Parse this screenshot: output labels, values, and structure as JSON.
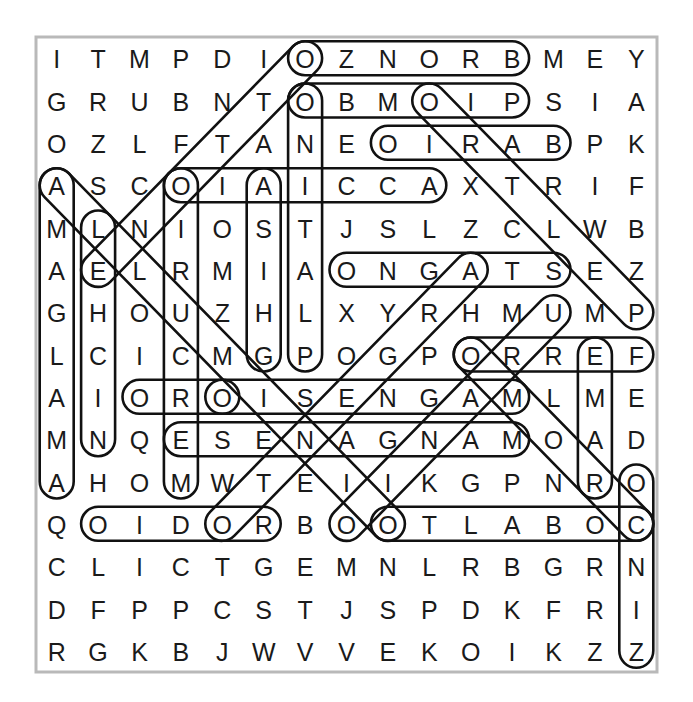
{
  "puzzle": {
    "type": "word-search",
    "rows": 15,
    "cols": 15,
    "grid": [
      [
        "I",
        "T",
        "M",
        "P",
        "D",
        "I",
        "O",
        "Z",
        "N",
        "O",
        "R",
        "B",
        "M",
        "E",
        "Y"
      ],
      [
        "G",
        "R",
        "U",
        "B",
        "N",
        "T",
        "O",
        "B",
        "M",
        "O",
        "I",
        "P",
        "S",
        "I",
        "A"
      ],
      [
        "O",
        "Z",
        "L",
        "F",
        "T",
        "A",
        "N",
        "E",
        "O",
        "I",
        "R",
        "A",
        "B",
        "P",
        "K"
      ],
      [
        "A",
        "S",
        "C",
        "O",
        "I",
        "A",
        "I",
        "C",
        "C",
        "A",
        "X",
        "T",
        "R",
        "I",
        "F"
      ],
      [
        "M",
        "L",
        "N",
        "I",
        "O",
        "S",
        "T",
        "J",
        "S",
        "L",
        "Z",
        "C",
        "L",
        "W",
        "B"
      ],
      [
        "A",
        "E",
        "L",
        "R",
        "M",
        "I",
        "A",
        "O",
        "N",
        "G",
        "A",
        "T",
        "S",
        "E",
        "Z"
      ],
      [
        "G",
        "H",
        "O",
        "U",
        "Z",
        "H",
        "L",
        "X",
        "Y",
        "R",
        "H",
        "M",
        "U",
        "M",
        "P"
      ],
      [
        "L",
        "C",
        "I",
        "C",
        "M",
        "G",
        "P",
        "O",
        "G",
        "P",
        "O",
        "R",
        "R",
        "E",
        "F"
      ],
      [
        "A",
        "I",
        "O",
        "R",
        "O",
        "I",
        "S",
        "E",
        "N",
        "G",
        "A",
        "M",
        "L",
        "M",
        "E"
      ],
      [
        "M",
        "N",
        "Q",
        "E",
        "S",
        "E",
        "N",
        "A",
        "G",
        "N",
        "A",
        "M",
        "O",
        "A",
        "D"
      ],
      [
        "A",
        "H",
        "O",
        "M",
        "W",
        "T",
        "E",
        "I",
        "I",
        "K",
        "G",
        "P",
        "N",
        "R",
        "O"
      ],
      [
        "Q",
        "O",
        "I",
        "D",
        "O",
        "R",
        "B",
        "O",
        "O",
        "T",
        "L",
        "A",
        "B",
        "O",
        "C"
      ],
      [
        "C",
        "L",
        "I",
        "C",
        "T",
        "G",
        "E",
        "M",
        "N",
        "L",
        "R",
        "B",
        "G",
        "R",
        "N"
      ],
      [
        "D",
        "F",
        "P",
        "P",
        "C",
        "S",
        "T",
        "J",
        "S",
        "P",
        "D",
        "K",
        "F",
        "R",
        "I"
      ],
      [
        "R",
        "G",
        "K",
        "B",
        "J",
        "W",
        "V",
        "V",
        "E",
        "K",
        "O",
        "I",
        "K",
        "Z",
        "Z"
      ]
    ],
    "found_words": [
      {
        "word": "BRONZO",
        "start": [
          1,
          12
        ],
        "end": [
          1,
          7
        ]
      },
      {
        "word": "PIOMBO",
        "start": [
          2,
          12
        ],
        "end": [
          2,
          7
        ]
      },
      {
        "word": "BARIO",
        "start": [
          3,
          13
        ],
        "end": [
          3,
          9
        ]
      },
      {
        "word": "ACCIAIO",
        "start": [
          4,
          10
        ],
        "end": [
          4,
          4
        ]
      },
      {
        "word": "STAGNO",
        "start": [
          6,
          13
        ],
        "end": [
          6,
          8
        ]
      },
      {
        "word": "FERRO",
        "start": [
          8,
          15
        ],
        "end": [
          8,
          11
        ]
      },
      {
        "word": "ORO",
        "start": [
          9,
          5
        ],
        "end": [
          9,
          3
        ]
      },
      {
        "word": "MAGNESIO",
        "start": [
          9,
          12
        ],
        "end": [
          9,
          5
        ]
      },
      {
        "word": "MANGANESE",
        "start": [
          10,
          12
        ],
        "end": [
          10,
          4
        ]
      },
      {
        "word": "RODIO",
        "start": [
          12,
          6
        ],
        "end": [
          12,
          2
        ]
      },
      {
        "word": "COBALTO",
        "start": [
          12,
          15
        ],
        "end": [
          12,
          9
        ]
      },
      {
        "word": "AMALGAMA",
        "start": [
          11,
          1
        ],
        "end": [
          4,
          1
        ]
      },
      {
        "word": "NICHEL",
        "start": [
          10,
          2
        ],
        "end": [
          5,
          2
        ]
      },
      {
        "word": "MERCURIO",
        "start": [
          11,
          4
        ],
        "end": [
          4,
          4
        ]
      },
      {
        "word": "GHISA",
        "start": [
          8,
          6
        ],
        "end": [
          4,
          6
        ]
      },
      {
        "word": "PLATINO",
        "start": [
          8,
          7
        ],
        "end": [
          2,
          7
        ]
      },
      {
        "word": "RAME",
        "start": [
          11,
          14
        ],
        "end": [
          8,
          14
        ]
      },
      {
        "word": "ZINCO",
        "start": [
          15,
          15
        ],
        "end": [
          11,
          15
        ]
      },
      {
        "word": "OTTONE",
        "start": [
          1,
          7
        ],
        "end": [
          6,
          2
        ]
      },
      {
        "word": "ALLUMINIO",
        "start": [
          4,
          1
        ],
        "end": [
          12,
          9
        ]
      },
      {
        "word": "PELTRO",
        "start": [
          7,
          15
        ],
        "end": [
          2,
          10
        ]
      },
      {
        "word": "ARGENTO",
        "start": [
          6,
          11
        ],
        "end": [
          12,
          5
        ]
      },
      {
        "word": "URANIO",
        "start": [
          7,
          13
        ],
        "end": [
          12,
          8
        ]
      },
      {
        "word": "CROMO",
        "start": [
          12,
          15
        ],
        "end": [
          8,
          11
        ]
      }
    ],
    "colors": {
      "letter": "#1a1a1a",
      "capsule_stroke": "#111111",
      "border": "#b9b9b9",
      "background": "#ffffff"
    }
  }
}
